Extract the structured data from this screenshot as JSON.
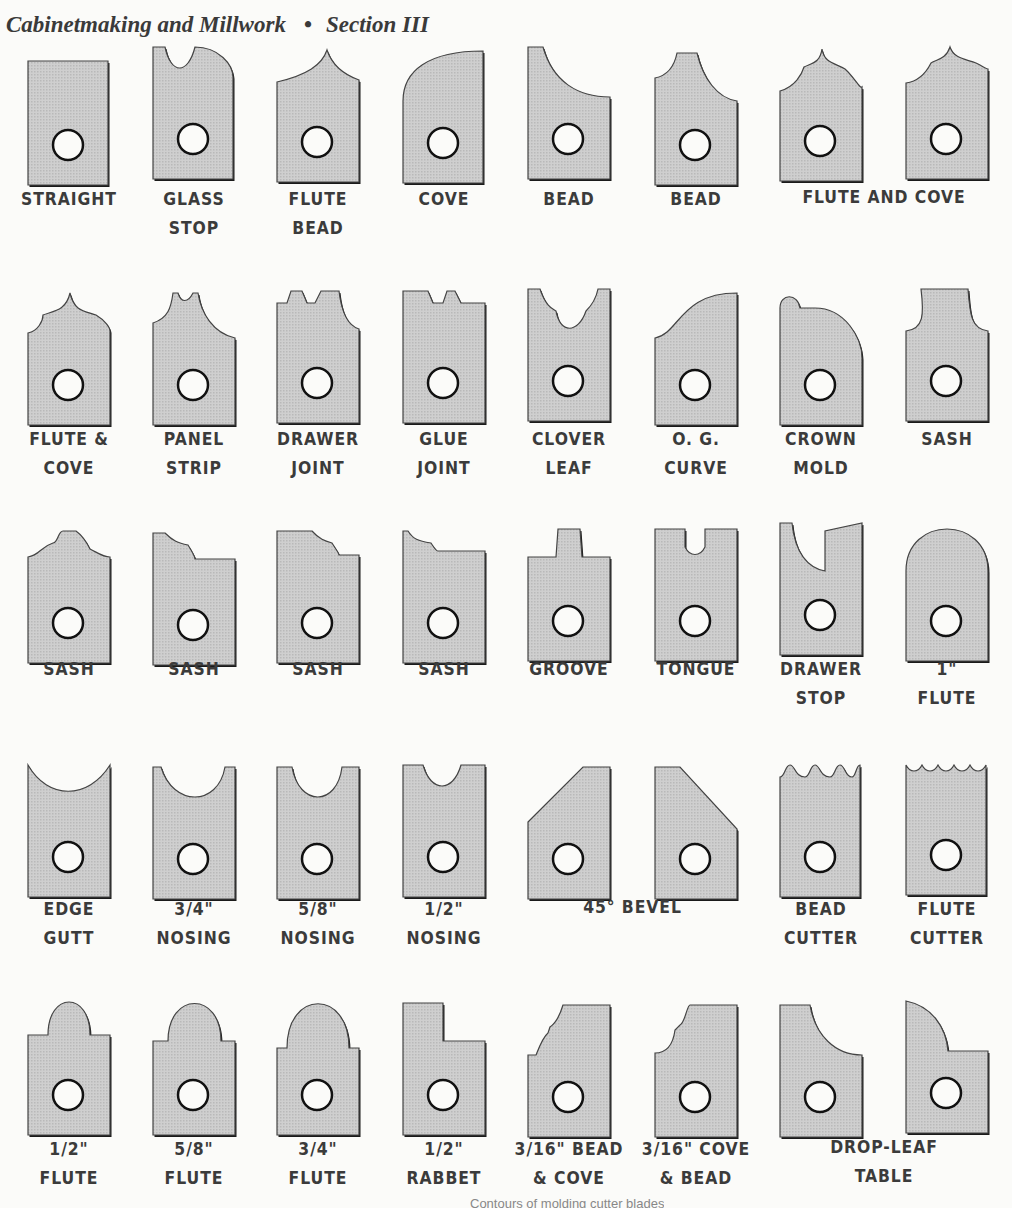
{
  "header": {
    "book_title": "Cabinetmaking and Millwork",
    "separator": "•",
    "section": "Section III"
  },
  "figure": {
    "caption_partial": "Contours of molding cutter blades",
    "fill_color": "#c9c9c9",
    "outline_color": "#1a1a1a",
    "rows": [
      {
        "blades": [
          {
            "name": "straight",
            "label_lines": [
              "STRAIGHT"
            ]
          },
          {
            "name": "glass-stop",
            "label_lines": [
              "GLASS",
              "STOP"
            ]
          },
          {
            "name": "flute-bead",
            "label_lines": [
              "FLUTE",
              "BEAD"
            ]
          },
          {
            "name": "cove",
            "label_lines": [
              "COVE"
            ]
          },
          {
            "name": "bead-1",
            "label_lines": [
              "BEAD"
            ]
          },
          {
            "name": "bead-2",
            "label_lines": [
              "BEAD"
            ]
          },
          {
            "name": "flute-and-cove-1",
            "label_lines": []
          },
          {
            "name": "flute-and-cove-2",
            "label_lines": []
          }
        ],
        "group_labels": [
          {
            "text": "FLUTE AND COVE",
            "spans": [
              6,
              7
            ]
          }
        ]
      },
      {
        "blades": [
          {
            "name": "flute-and-cove",
            "label_lines": [
              "FLUTE &",
              "COVE"
            ]
          },
          {
            "name": "panel-strip",
            "label_lines": [
              "PANEL",
              "STRIP"
            ]
          },
          {
            "name": "drawer-joint",
            "label_lines": [
              "DRAWER",
              "JOINT"
            ]
          },
          {
            "name": "glue-joint",
            "label_lines": [
              "GLUE",
              "JOINT"
            ]
          },
          {
            "name": "clover-leaf",
            "label_lines": [
              "CLOVER",
              "LEAF"
            ]
          },
          {
            "name": "og-curve",
            "label_lines": [
              "O. G.",
              "CURVE"
            ]
          },
          {
            "name": "crown-mold",
            "label_lines": [
              "CROWN",
              "MOLD"
            ]
          },
          {
            "name": "sash",
            "label_lines": [
              "SASH"
            ]
          }
        ]
      },
      {
        "blades": [
          {
            "name": "sash-1",
            "label_lines": [
              "SASH"
            ]
          },
          {
            "name": "sash-2",
            "label_lines": [
              "SASH"
            ]
          },
          {
            "name": "sash-3",
            "label_lines": [
              "SASH"
            ]
          },
          {
            "name": "sash-4",
            "label_lines": [
              "SASH"
            ]
          },
          {
            "name": "groove",
            "label_lines": [
              "GROOVE"
            ]
          },
          {
            "name": "tongue",
            "label_lines": [
              "TONGUE"
            ]
          },
          {
            "name": "drawer-stop",
            "label_lines": [
              "DRAWER",
              "STOP"
            ]
          },
          {
            "name": "one-inch-flute",
            "label_lines": [
              "1\"",
              "FLUTE"
            ]
          }
        ]
      },
      {
        "blades": [
          {
            "name": "edge-gutt",
            "label_lines": [
              "EDGE",
              "GUTT"
            ]
          },
          {
            "name": "three-quarter-nosing",
            "label_lines": [
              "3/4\"",
              "NOSING"
            ]
          },
          {
            "name": "five-eighth-nosing",
            "label_lines": [
              "5/8\"",
              "NOSING"
            ]
          },
          {
            "name": "half-nosing",
            "label_lines": [
              "1/2\"",
              "NOSING"
            ]
          },
          {
            "name": "bevel-1",
            "label_lines": []
          },
          {
            "name": "bevel-2",
            "label_lines": []
          },
          {
            "name": "bead-cutter",
            "label_lines": [
              "BEAD",
              "CUTTER"
            ]
          },
          {
            "name": "flute-cutter",
            "label_lines": [
              "FLUTE",
              "CUTTER"
            ]
          }
        ],
        "group_labels": [
          {
            "text": "45° BEVEL",
            "spans": [
              4,
              5
            ]
          }
        ]
      },
      {
        "blades": [
          {
            "name": "half-flute",
            "label_lines": [
              "1/2\"",
              "FLUTE"
            ]
          },
          {
            "name": "five-eighth-flute",
            "label_lines": [
              "5/8\"",
              "FLUTE"
            ]
          },
          {
            "name": "three-quarter-flute",
            "label_lines": [
              "3/4\"",
              "FLUTE"
            ]
          },
          {
            "name": "half-rabbet",
            "label_lines": [
              "1/2\"",
              "RABBET"
            ]
          },
          {
            "name": "bead-and-cove",
            "label_lines": [
              "3/16\" BEAD",
              "& COVE"
            ]
          },
          {
            "name": "cove-and-bead",
            "label_lines": [
              "3/16\" COVE",
              "& BEAD"
            ]
          },
          {
            "name": "drop-leaf-1",
            "label_lines": []
          },
          {
            "name": "drop-leaf-2",
            "label_lines": []
          }
        ],
        "group_labels": [
          {
            "text": "DROP-LEAF\nTABLE",
            "spans": [
              6,
              7
            ]
          }
        ]
      }
    ]
  }
}
